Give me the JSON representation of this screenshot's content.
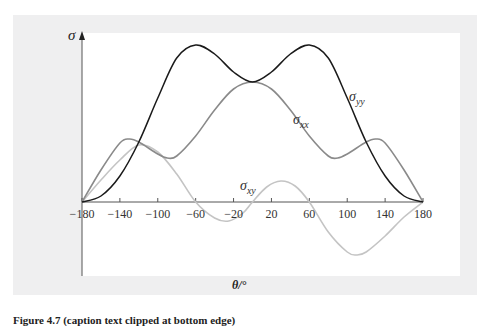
{
  "figure": {
    "background_color": "#efeff0",
    "plot_background": "#ffffff"
  },
  "chart_data": {
    "type": "line",
    "title": "",
    "xlabel": "θ/°",
    "ylabel": "σ",
    "xlim": [
      -180,
      180
    ],
    "x_ticks": [
      -180,
      -140,
      -100,
      -60,
      -20,
      20,
      60,
      100,
      140,
      180
    ],
    "y_ticks": [],
    "grid": false,
    "legend": "inline labels",
    "y_units": "arbitrary (relative, axis unlabelled); 1 unit ≈ peak σyy / 15.7",
    "series": [
      {
        "name": "σyy",
        "label_main": "σ",
        "label_sub": "yy",
        "color": "#1a1a1a",
        "x": [
          -180,
          -160,
          -140,
          -120,
          -100,
          -80,
          -60,
          -40,
          -20,
          0,
          20,
          40,
          60,
          80,
          100,
          120,
          140,
          160,
          180
        ],
        "values": [
          0,
          0.6,
          2.6,
          6.0,
          10.4,
          14.4,
          15.7,
          14.8,
          13.0,
          12.0,
          13.0,
          14.8,
          15.7,
          14.4,
          10.4,
          6.0,
          2.6,
          0.6,
          0
        ]
      },
      {
        "name": "σxx",
        "label_main": "σ",
        "label_sub": "xx",
        "color": "#8a8a8a",
        "x": [
          -180,
          -160,
          -140,
          -130,
          -120,
          -100,
          -90,
          -80,
          -60,
          -40,
          -20,
          0,
          20,
          40,
          60,
          80,
          90,
          100,
          120,
          130,
          140,
          160,
          180
        ],
        "values": [
          0,
          3.2,
          5.9,
          6.3,
          6.0,
          4.8,
          4.4,
          4.6,
          6.6,
          9.2,
          11.3,
          12.0,
          11.3,
          9.2,
          6.6,
          4.6,
          4.4,
          4.8,
          6.0,
          6.3,
          5.9,
          3.2,
          0
        ]
      },
      {
        "name": "σxy",
        "label_main": "σ",
        "label_sub": "xy",
        "color": "#c4c4c4",
        "x": [
          -180,
          -160,
          -140,
          -120,
          -100,
          -80,
          -60,
          -40,
          -25,
          -10,
          0,
          15,
          30,
          45,
          60,
          80,
          100,
          110,
          120,
          140,
          160,
          180
        ],
        "values": [
          0,
          2.2,
          4.2,
          5.7,
          5.0,
          2.8,
          0,
          -1.6,
          -1.9,
          -1.1,
          0,
          1.5,
          2.1,
          1.6,
          0,
          -3.0,
          -5.0,
          -5.3,
          -5.0,
          -3.4,
          -1.5,
          0
        ]
      }
    ]
  },
  "caption": {
    "text": "Figure 4.7 (caption text clipped at bottom edge)"
  }
}
